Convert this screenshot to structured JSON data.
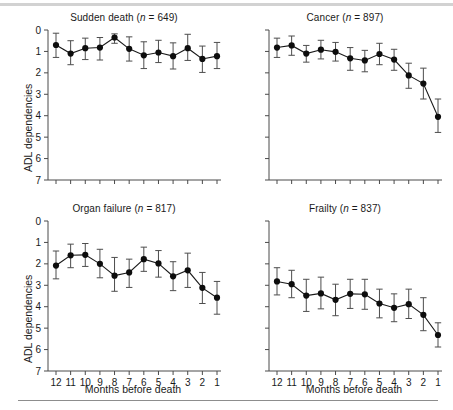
{
  "figure": {
    "ylabel": "ADL dependencies",
    "xlabel": "Months before death",
    "xtick_labels": [
      "12",
      "11",
      "10",
      "9",
      "8",
      "7",
      "6",
      "5",
      "4",
      "3",
      "2",
      "1"
    ],
    "ytick_labels": [
      "0",
      "1",
      "2",
      "3",
      "4",
      "5",
      "6",
      "7"
    ],
    "rule_color": "#d2d2d2",
    "marker_color": "#0d0d0d",
    "axis_color": "#4a4a4a"
  },
  "panels": [
    {
      "key": "sudden-death",
      "title_main": "Sudden death",
      "title_n": "= 649)",
      "n": 649,
      "show_xlabels": false,
      "show_ylabel": true
    },
    {
      "key": "cancer",
      "title_main": "Cancer",
      "title_n": "= 897)",
      "n": 897,
      "show_xlabels": false,
      "show_ylabel": false
    },
    {
      "key": "organ-failure",
      "title_main": "Organ failure",
      "title_n": "= 817)",
      "n": 817,
      "show_xlabels": true,
      "show_ylabel": true
    },
    {
      "key": "frailty",
      "title_main": "Frailty",
      "title_n": "= 837)",
      "n": 837,
      "show_xlabels": true,
      "show_ylabel": false
    }
  ],
  "chart_data": [
    {
      "type": "line",
      "title": "Sudden death (n = 649)",
      "xlabel": "Months before death",
      "ylabel": "ADL dependencies",
      "x": [
        12,
        11,
        10,
        9,
        8,
        7,
        6,
        5,
        4,
        3,
        2,
        1
      ],
      "values": [
        0.7,
        1.1,
        0.85,
        0.82,
        0.35,
        0.88,
        1.18,
        1.05,
        1.22,
        0.85,
        1.35,
        1.22
      ],
      "err_low": [
        0.15,
        0.5,
        0.38,
        0.35,
        0.18,
        0.32,
        0.55,
        0.48,
        0.6,
        0.2,
        0.75,
        0.58
      ],
      "err_high": [
        1.28,
        1.62,
        1.38,
        1.4,
        0.62,
        1.45,
        1.8,
        1.52,
        1.82,
        1.42,
        1.98,
        1.8
      ],
      "ylim": [
        0,
        7
      ],
      "y_inverted": true,
      "grid": false,
      "legend": "none"
    },
    {
      "type": "line",
      "title": "Cancer (n = 897)",
      "xlabel": "Months before death",
      "ylabel": "ADL dependencies",
      "x": [
        12,
        11,
        10,
        9,
        8,
        7,
        6,
        5,
        4,
        3,
        2,
        1
      ],
      "values": [
        0.82,
        0.72,
        1.1,
        0.92,
        1.02,
        1.32,
        1.42,
        1.12,
        1.38,
        2.12,
        2.5,
        4.05
      ],
      "err_low": [
        0.38,
        0.28,
        0.72,
        0.48,
        0.58,
        0.82,
        0.95,
        0.62,
        0.9,
        1.55,
        1.78,
        3.22
      ],
      "err_high": [
        1.28,
        1.18,
        1.5,
        1.35,
        1.45,
        1.88,
        1.95,
        1.62,
        1.88,
        2.72,
        3.22,
        4.78
      ],
      "ylim": [
        0,
        7
      ],
      "y_inverted": true,
      "grid": false,
      "legend": "none"
    },
    {
      "type": "line",
      "title": "Organ failure (n = 817)",
      "xlabel": "Months before death",
      "ylabel": "ADL dependencies",
      "x": [
        12,
        11,
        10,
        9,
        8,
        7,
        6,
        5,
        4,
        3,
        2,
        1
      ],
      "values": [
        2.08,
        1.6,
        1.58,
        2.0,
        2.55,
        2.4,
        1.78,
        1.98,
        2.58,
        2.3,
        3.12,
        3.58
      ],
      "err_low": [
        1.4,
        1.08,
        1.05,
        1.32,
        1.7,
        1.78,
        1.22,
        1.38,
        1.9,
        1.5,
        2.4,
        2.82
      ],
      "err_high": [
        2.7,
        2.18,
        2.12,
        2.65,
        3.28,
        3.1,
        2.35,
        2.62,
        3.25,
        3.1,
        3.85,
        4.35
      ],
      "ylim": [
        0,
        7
      ],
      "y_inverted": true,
      "grid": false,
      "legend": "none"
    },
    {
      "type": "line",
      "title": "Frailty (n = 837)",
      "xlabel": "Months before death",
      "ylabel": "ADL dependencies",
      "x": [
        12,
        11,
        10,
        9,
        8,
        7,
        6,
        5,
        4,
        3,
        2,
        1
      ],
      "values": [
        2.82,
        2.95,
        3.48,
        3.38,
        3.68,
        3.4,
        3.42,
        3.85,
        4.05,
        3.88,
        4.38,
        5.32
      ],
      "err_low": [
        2.18,
        2.3,
        2.72,
        2.62,
        2.95,
        2.72,
        2.72,
        3.18,
        3.4,
        3.18,
        3.58,
        4.75
      ],
      "err_high": [
        3.45,
        3.58,
        4.22,
        4.1,
        4.42,
        4.08,
        4.12,
        4.52,
        4.7,
        4.55,
        5.12,
        5.88
      ],
      "ylim": [
        0,
        7
      ],
      "y_inverted": true,
      "grid": false,
      "legend": "none"
    }
  ]
}
